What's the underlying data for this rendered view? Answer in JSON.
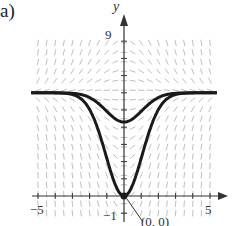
{
  "panel_label": "a)",
  "axes": {
    "x_label": "",
    "y_label": "y",
    "x_ticks": {
      "min_label": "−5",
      "max_label": "5"
    },
    "y_ticks": {
      "top_label": "9",
      "bottom_label": "−1"
    },
    "xlim": [
      -5,
      5
    ],
    "ylim": [
      -1,
      9
    ]
  },
  "annotation": {
    "point_label": "(0, 0)",
    "x": 0,
    "y": 0
  },
  "curves": [
    {
      "name": "equilibrium-upper",
      "description": "horizontal asymptote near y=6 dipping to ~4.3 at x=0"
    },
    {
      "name": "solution-through-origin",
      "description": "bell-shaped dip reaching (0,0), asymptotic to y=6"
    }
  ],
  "colors": {
    "curve": "#1a1a1a",
    "field": "#b0b0b0",
    "axis": "#333333"
  }
}
